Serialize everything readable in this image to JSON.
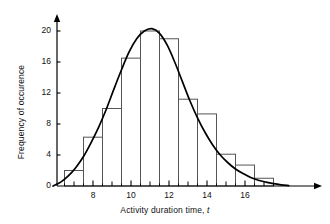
{
  "chart_data": {
    "type": "bar",
    "title": "",
    "subtitle": "",
    "xlabel": "Activity duration time, t",
    "xlabel_text": "Activity duration time, ",
    "xlabel_variable": "t",
    "ylabel": "Frequency of occurence",
    "xlim": [
      5.6,
      19.0
    ],
    "ylim": [
      0,
      21.5
    ],
    "grid": false,
    "legend": null,
    "x_tick_labels": [
      "8",
      "10",
      "12",
      "14",
      "16"
    ],
    "x_tick_values": [
      8,
      10,
      12,
      14,
      16
    ],
    "x_minor_tick_values": [
      7,
      9,
      11,
      13,
      15,
      17
    ],
    "x_subtick_values": [
      6.5,
      7.5,
      8.5,
      9.5,
      10.5,
      11.5,
      12.5,
      13.5,
      14.5,
      15.5,
      16.5,
      17.5
    ],
    "y_tick_labels": [
      "0",
      "4",
      "8",
      "12",
      "16",
      "20"
    ],
    "y_tick_values": [
      0,
      4,
      8,
      12,
      16,
      20
    ],
    "bin_edges": [
      6.5,
      7.5,
      8.5,
      9.5,
      10.5,
      11.5,
      12.5,
      13.5,
      14.5,
      15.5,
      16.5,
      17.5
    ],
    "bin_centers": [
      7,
      8,
      9,
      10,
      11,
      12,
      13,
      14,
      15,
      16,
      17
    ],
    "categories": [
      "6.5-7.5",
      "7.5-8.5",
      "8.5-9.5",
      "9.5-10.5",
      "10.5-11.5",
      "11.5-12.5",
      "12.5-13.5",
      "13.5-14.5",
      "14.5-15.5",
      "15.5-16.5",
      "16.5-17.5"
    ],
    "values": [
      2,
      6.3,
      10,
      16.5,
      20,
      19,
      11.2,
      9.3,
      4.1,
      2.7,
      1
    ],
    "series": [
      {
        "name": "Frequency histogram",
        "type": "bar",
        "values": [
          2,
          6.3,
          10,
          16.5,
          20,
          19,
          11.2,
          9.3,
          4.1,
          2.7,
          1
        ]
      },
      {
        "name": "Fitted distribution curve",
        "type": "line",
        "x": [
          5.9,
          6.3,
          6.7,
          7.1,
          7.5,
          7.9,
          8.3,
          8.7,
          9.1,
          9.5,
          9.9,
          10.3,
          10.7,
          11.1,
          11.5,
          11.9,
          12.3,
          12.7,
          13.1,
          13.5,
          13.9,
          14.3,
          14.7,
          15.1,
          15.5,
          15.9,
          16.3,
          16.7,
          17.1,
          17.5,
          17.9,
          18.3
        ],
        "values": [
          0,
          0.5,
          1.3,
          2.4,
          3.8,
          5.6,
          7.6,
          9.9,
          12.5,
          15.0,
          17.3,
          19.0,
          20.0,
          20.3,
          19.7,
          18.2,
          16.0,
          13.5,
          11.0,
          8.8,
          6.9,
          5.3,
          4.0,
          3.0,
          2.2,
          1.6,
          1.1,
          0.75,
          0.5,
          0.3,
          0.15,
          0.05
        ]
      }
    ],
    "colors": {
      "axis": "#000000",
      "bar_stroke": "#555555",
      "bar_fill": "#ffffff",
      "curve": "#000000",
      "background": "#ffffff",
      "text": "#111111"
    },
    "axis_arrows": {
      "x_arrow": "right-arrow-head",
      "y_arrow": "up-arrow-head"
    }
  }
}
